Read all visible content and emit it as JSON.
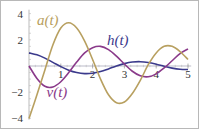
{
  "chart_data": {
    "type": "line",
    "title": "",
    "xlabel": "",
    "ylabel": "",
    "xlim": [
      0,
      5
    ],
    "ylim": [
      -4,
      4
    ],
    "x_ticks": [
      "1",
      "2",
      "3",
      "4",
      "5"
    ],
    "y_ticks": [
      "4",
      "2",
      "-2",
      "-4"
    ],
    "grid": false,
    "x": [
      0,
      0.25,
      0.5,
      0.75,
      1,
      1.25,
      1.5,
      1.75,
      2,
      2.25,
      2.5,
      2.75,
      3,
      3.25,
      3.5,
      3.75,
      4,
      4.25,
      4.5,
      4.75,
      5
    ],
    "series": [
      {
        "name": "h(t)",
        "color": "#3b3a8c",
        "label_pos": [
          2.45,
          1.6
        ],
        "values": [
          1.0,
          0.85,
          0.6,
          0.28,
          -0.05,
          -0.32,
          -0.5,
          -0.58,
          -0.55,
          -0.42,
          -0.22,
          0.0,
          0.18,
          0.3,
          0.33,
          0.27,
          0.14,
          -0.02,
          -0.16,
          -0.25,
          -0.27
        ]
      },
      {
        "name": "v(t)",
        "color": "#8a3a8a",
        "label_pos": [
          0.55,
          -2.4
        ],
        "values": [
          0.0,
          -0.95,
          -1.55,
          -1.6,
          -1.2,
          -0.5,
          0.3,
          1.0,
          1.4,
          1.5,
          1.25,
          0.75,
          0.15,
          -0.4,
          -0.75,
          -0.82,
          -0.6,
          -0.15,
          0.4,
          0.95,
          1.3
        ]
      },
      {
        "name": "a(t)",
        "color": "#b8a060",
        "label_pos": [
          0.25,
          3.1
        ],
        "values": [
          -4.0,
          -2.2,
          -0.3,
          1.6,
          2.9,
          3.3,
          2.9,
          1.9,
          0.5,
          -1.0,
          -2.2,
          -2.8,
          -2.75,
          -2.1,
          -1.1,
          0.1,
          1.0,
          1.5,
          1.5,
          1.1,
          0.5
        ]
      }
    ]
  }
}
